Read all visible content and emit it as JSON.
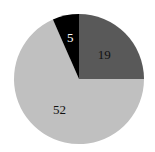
{
  "chart_data": {
    "type": "pie",
    "title": "",
    "categories": [
      "A",
      "B",
      "C"
    ],
    "values": [
      19,
      52,
      5
    ],
    "labels": [
      "19",
      "52",
      "5"
    ],
    "colors": [
      "#595959",
      "#c0c0c0",
      "#000000"
    ],
    "label_colors": [
      "#111111",
      "#111111",
      "#ffffff"
    ],
    "start_angle_deg": 0,
    "direction": "clockwise",
    "legend": "none"
  }
}
